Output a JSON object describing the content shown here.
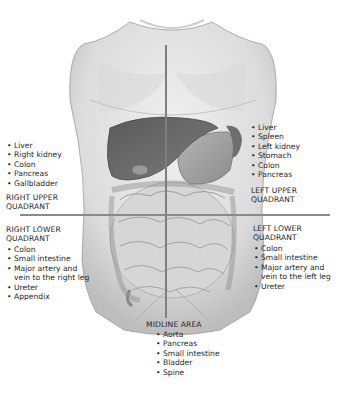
{
  "figure": {
    "colors": {
      "skin": "#e6e6e6",
      "organs_dark": "#6a6a6a",
      "intestine": "#d2d2d2",
      "divider_line": "#8a8a8a",
      "text": "#262626"
    }
  },
  "quadrants": {
    "right_upper": {
      "title_line1": "RIGHT UPPER",
      "title_line2": "QUADRANT",
      "items": [
        "Liver",
        "Right kidney",
        "Colon",
        "Pancreas",
        "Gallbladder"
      ]
    },
    "left_upper": {
      "title_line1": "LEFT UPPER",
      "title_line2": "QUADRANT",
      "items": [
        "Liver",
        "Spleen",
        "Left kidney",
        "Stomach",
        "Colon",
        "Pancreas"
      ]
    },
    "right_lower": {
      "title_line1": "RIGHT LOWER",
      "title_line2": "QUADRANT",
      "items": [
        "Colon",
        "Small intestine",
        "Major artery and",
        "vein to the right leg",
        "Ureter",
        "Appendix"
      ]
    },
    "left_lower": {
      "title_line1": "LEFT LOWER",
      "title_line2": "QUADRANT",
      "items": [
        "Colon",
        "Small intestine",
        "Major artery and",
        "vein to the left leg",
        "Ureter"
      ]
    },
    "midline": {
      "title": "MIDLINE AREA",
      "items": [
        "Aorta",
        "Pancreas",
        "Small intestine",
        "Bladder",
        "Spine"
      ]
    }
  }
}
